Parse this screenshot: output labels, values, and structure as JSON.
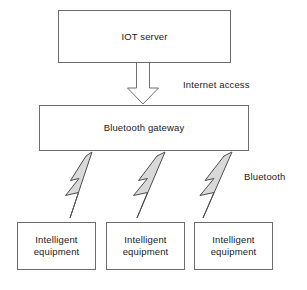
{
  "diagram": {
    "colors": {
      "background": "#ffffff",
      "box_stroke": "#6b6b6b",
      "connector_stroke": "#4d4d4d",
      "bolt_fill": "#d9d9d9",
      "text": "#1a1a1a"
    },
    "nodes": [
      {
        "id": "iot-server",
        "label": "IOT server",
        "shape": "rectangle"
      },
      {
        "id": "bluetooth-gateway",
        "label": "Bluetooth gateway",
        "shape": "rectangle"
      },
      {
        "id": "intelligent-equipment-1",
        "label": "Intelligent\nequipment",
        "shape": "rectangle"
      },
      {
        "id": "intelligent-equipment-2",
        "label": "Intelligent\nequipment",
        "shape": "rectangle"
      },
      {
        "id": "intelligent-equipment-3",
        "label": "Intelligent\nequipment",
        "shape": "rectangle"
      }
    ],
    "edges": [
      {
        "id": "edge-internet",
        "from": "iot-server",
        "to": "bluetooth-gateway",
        "label": "Internet access",
        "style": "hollow-block-arrow"
      },
      {
        "id": "edge-bluetooth-1",
        "from": "bluetooth-gateway",
        "to": "intelligent-equipment-1",
        "label": "",
        "style": "lightning-bolt"
      },
      {
        "id": "edge-bluetooth-2",
        "from": "bluetooth-gateway",
        "to": "intelligent-equipment-2",
        "label": "",
        "style": "lightning-bolt"
      },
      {
        "id": "edge-bluetooth-3",
        "from": "bluetooth-gateway",
        "to": "intelligent-equipment-3",
        "label": "Bluetooth",
        "style": "lightning-bolt"
      }
    ],
    "labels": {
      "internet_access": "Internet access",
      "bluetooth": "Bluetooth"
    }
  }
}
